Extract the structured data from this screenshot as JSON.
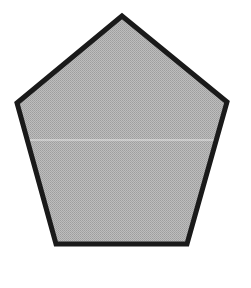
{
  "figure": {
    "shape": "pentagon",
    "vertices": [
      [
        122,
        16
      ],
      [
        17,
        103
      ],
      [
        56,
        244
      ],
      [
        187,
        244
      ],
      [
        227,
        102
      ]
    ],
    "fill": "#b3b3b3",
    "stroke": "#1a1a1a",
    "stroke_width": 5,
    "artifact_line_y": 140
  }
}
